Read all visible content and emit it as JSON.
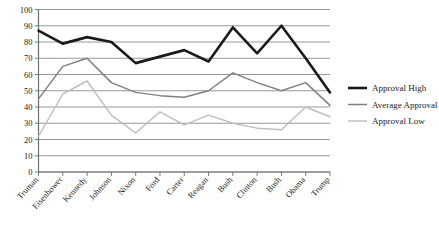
{
  "chart_data": {
    "type": "line",
    "title": "",
    "xlabel": "",
    "ylabel": "",
    "ylim": [
      0,
      100
    ],
    "ytick_step": 10,
    "yticks": [
      "0",
      "10",
      "20",
      "30",
      "40",
      "50",
      "60",
      "70",
      "80",
      "90",
      "100"
    ],
    "grid": true,
    "legend_position": "right",
    "categories": [
      "Truman",
      "Eisenhower",
      "Kennedy",
      "Johnson",
      "Nixon",
      "Ford",
      "Carter",
      "Reagan",
      "Bush",
      "Clinton",
      "Bush",
      "Obama",
      "Trump"
    ],
    "series": [
      {
        "name": "Approval High",
        "color": "#1a1a1a",
        "width": 2.6,
        "values": [
          87,
          79,
          83,
          80,
          67,
          71,
          75,
          68,
          89,
          73,
          90,
          70,
          49
        ]
      },
      {
        "name": "Average Approval",
        "color": "#808080",
        "width": 1.5,
        "values": [
          45,
          65,
          70,
          55,
          49,
          47,
          46,
          50,
          61,
          55,
          50,
          55,
          41
        ]
      },
      {
        "name": "Approval Low",
        "color": "#bfbfbf",
        "width": 1.5,
        "values": [
          22,
          48,
          56,
          35,
          24,
          37,
          29,
          35,
          30,
          27,
          26,
          40,
          34
        ]
      }
    ]
  },
  "legend": {
    "items": [
      {
        "label": "Approval High",
        "color": "#1a1a1a",
        "width": 2.6
      },
      {
        "label": "Average Approval",
        "color": "#808080",
        "width": 1.5
      },
      {
        "label": "Approval Low",
        "color": "#bfbfbf",
        "width": 1.5
      }
    ]
  },
  "axes": {
    "grid_color": "#8c8c8c",
    "axis_color": "#6e6e6e"
  }
}
